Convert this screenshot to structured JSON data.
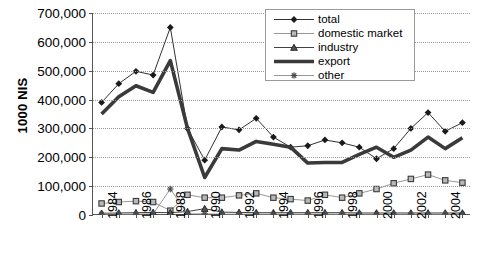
{
  "chart_data": {
    "type": "line",
    "title": "",
    "xlabel": "",
    "ylabel": "1000 NIS",
    "ylim": [
      0,
      700000
    ],
    "ytick_labels": [
      "0",
      "100,000",
      "200,000",
      "300,000",
      "400,000",
      "500,000",
      "600,000",
      "700,000"
    ],
    "ytick_values": [
      0,
      100000,
      200000,
      300000,
      400000,
      500000,
      600000,
      700000
    ],
    "grid": true,
    "legend_position": "top-right",
    "x": [
      1984,
      1985,
      1986,
      1987,
      1988,
      1989,
      1990,
      1991,
      1992,
      1993,
      1994,
      1995,
      1996,
      1997,
      1998,
      1999,
      2000,
      2001,
      2002,
      2003,
      2004,
      2005
    ],
    "xtick_labels": [
      "1984",
      "",
      "1986",
      "",
      "1988",
      "",
      "1990",
      "",
      "1992",
      "",
      "1994",
      "",
      "1996",
      "",
      "1998",
      "",
      "2000",
      "",
      "2002",
      "",
      "2004",
      ""
    ],
    "series": [
      {
        "name": "total",
        "marker": "diamond",
        "color": "#1a1a1a",
        "values": [
          390000,
          455000,
          498000,
          485000,
          650000,
          300000,
          190000,
          305000,
          295000,
          335000,
          270000,
          235000,
          240000,
          260000,
          250000,
          235000,
          195000,
          230000,
          300000,
          355000,
          290000,
          320000
        ]
      },
      {
        "name": "domestic market",
        "marker": "square",
        "color": "#8c8c8c",
        "values": [
          40000,
          45000,
          48000,
          45000,
          15000,
          70000,
          60000,
          60000,
          68000,
          75000,
          60000,
          55000,
          50000,
          70000,
          60000,
          75000,
          90000,
          110000,
          125000,
          140000,
          120000,
          112000
        ]
      },
      {
        "name": "industry",
        "marker": "triangle",
        "color": "#2b2b2b",
        "values": [
          6000,
          7000,
          8000,
          9000,
          8000,
          12000,
          22000,
          10000,
          9000,
          8000,
          8000,
          8000,
          8000,
          8000,
          8000,
          7000,
          7000,
          7000,
          7000,
          7000,
          7000,
          7000
        ]
      },
      {
        "name": "export",
        "marker": "none",
        "color": "#3a3a3a",
        "thick": true,
        "values": [
          350000,
          410000,
          448000,
          425000,
          535000,
          300000,
          130000,
          230000,
          225000,
          255000,
          245000,
          235000,
          180000,
          182000,
          182000,
          210000,
          235000,
          200000,
          225000,
          270000,
          230000,
          268000
        ]
      },
      {
        "name": "other",
        "marker": "asterisk",
        "color": "#8c8c8c",
        "values": [
          3000,
          3000,
          3000,
          4000,
          90000,
          4000,
          4000,
          3000,
          3000,
          3000,
          3000,
          3000,
          3000,
          3000,
          3000,
          3000,
          3000,
          3000,
          3000,
          3000,
          3000,
          3000
        ]
      }
    ]
  },
  "legend": {
    "items": [
      {
        "label": "total"
      },
      {
        "label": "domestic market"
      },
      {
        "label": "industry"
      },
      {
        "label": "export"
      },
      {
        "label": "other"
      }
    ]
  }
}
